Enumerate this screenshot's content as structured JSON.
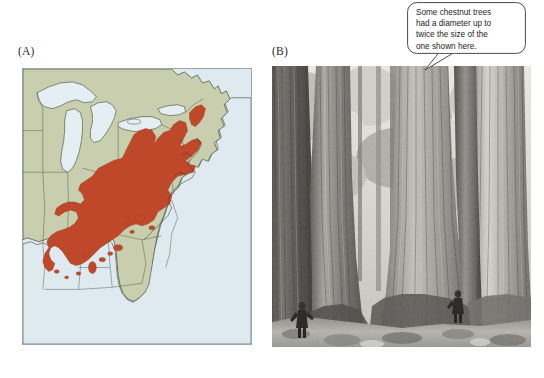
{
  "figure": {
    "background_color": "#ffffff",
    "panels": [
      {
        "id": "A",
        "label": "(A)",
        "kind": "range-map"
      },
      {
        "id": "B",
        "label": "(B)",
        "kind": "photograph"
      }
    ]
  },
  "map": {
    "label": "(A)",
    "region": "Eastern North America",
    "colors": {
      "range_fill": "#c0482a",
      "land_fill": "#c9ceaf",
      "water_fill": "#dfeaf0",
      "lake_fill": "#e4eef3",
      "border_line": "#3c4a32",
      "panel_border": "#9aa7ad"
    },
    "features": {
      "water_bodies": [
        "Atlantic Ocean",
        "Gulf of Mexico",
        "Great Lakes"
      ],
      "state_boundaries": true,
      "range_overlay": "American chestnut historical range"
    }
  },
  "photo": {
    "label": "(B)",
    "subject": "Stand of large American chestnut trees",
    "palette": "black-and-white",
    "scale_figures": 2,
    "colors": {
      "bark_dark": "#4a4845",
      "bark_mid": "#7d7b76",
      "bark_light": "#cfcdc7",
      "canopy_light": "#e8e6e0",
      "ground": "#a8a6a0"
    }
  },
  "callout": {
    "name": "chestnut-diameter-note",
    "lines": [
      "Some chestnut trees",
      "had a diameter up to",
      "twice the size of the",
      "one shown here."
    ],
    "text": "Some chestnut trees had a diameter up to twice the size of the one shown here.",
    "colors": {
      "fill": "#ffffff",
      "stroke": "#4a4a4a",
      "text": "#1d1d1d"
    },
    "tail_target": "tree trunk in photo"
  }
}
